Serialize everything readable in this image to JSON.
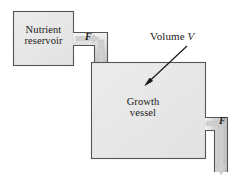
{
  "figure": {
    "type": "diagram",
    "background_color": "#ffffff",
    "outline_color": "#4d4d4d",
    "fill_color": "#e8e8e8",
    "arrow_fill_color": "#d0d0d0",
    "annotation_color": "#1a1a1a"
  },
  "reservoir": {
    "label_line1": "Nutrient",
    "label_line2": "reservoir"
  },
  "vessel": {
    "label_line1": "Growth",
    "label_line2": "vessel"
  },
  "annotation": {
    "volume_text": "Volume",
    "volume_symbol": "V"
  },
  "flows": {
    "inlet_label": "F",
    "outlet_label": "F"
  }
}
